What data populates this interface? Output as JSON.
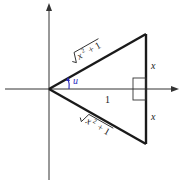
{
  "diagram": {
    "axes": {
      "horizontal": "x-axis",
      "vertical": "y-axis"
    },
    "labels": {
      "upper_hypotenuse": "x",
      "upper_hypotenuse_sup": "2",
      "upper_hypotenuse_rest": " + 1",
      "lower_hypotenuse": "x",
      "lower_hypotenuse_sup": "2",
      "lower_hypotenuse_rest": " + 1",
      "upper_side": "x",
      "lower_side": "x",
      "base": "1",
      "angle": "u"
    },
    "colors": {
      "line": "#1a1a1a",
      "angle_label": "#2b2bbf",
      "axis": "#333333"
    }
  }
}
